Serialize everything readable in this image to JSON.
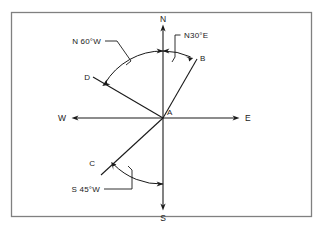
{
  "figure": {
    "kind": "compass-bearing-diagram",
    "background_color": "#ffffff",
    "line_color": "#1a1a1a",
    "border_color": "#808080"
  },
  "cardinals": {
    "north": "N",
    "south": "S",
    "east": "E",
    "west": "W"
  },
  "points": {
    "origin": "A",
    "b": "B",
    "c": "C",
    "d": "D"
  },
  "bearings": {
    "n30e": "N30°E",
    "n60w": "N 60°W",
    "s45w": "S 45°W"
  }
}
